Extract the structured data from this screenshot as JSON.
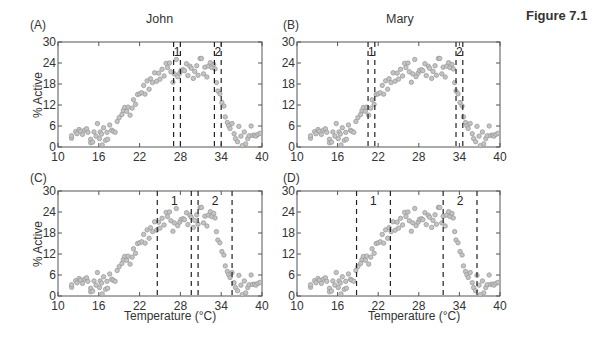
{
  "figure": {
    "title": "Figure 7.1"
  },
  "chart_data": [
    {
      "panel": "(A)",
      "title": "John",
      "type": "scatter",
      "xlabel": "",
      "ylabel": "% Active",
      "xlim": [
        10,
        40
      ],
      "ylim": [
        0,
        30
      ],
      "xticks": [
        10,
        16,
        22,
        28,
        34,
        40
      ],
      "yticks": [
        0,
        6,
        12,
        18,
        24,
        30
      ],
      "intervals": [
        {
          "label": "1",
          "from": 27,
          "to": 28
        },
        {
          "label": "2",
          "from": 33,
          "to": 34
        }
      ]
    },
    {
      "panel": "(B)",
      "title": "Mary",
      "type": "scatter",
      "xlabel": "",
      "ylabel": "",
      "xlim": [
        10,
        40
      ],
      "ylim": [
        0,
        30
      ],
      "xticks": [
        10,
        16,
        22,
        28,
        34,
        40
      ],
      "yticks": [
        0,
        6,
        12,
        18,
        24,
        30
      ],
      "intervals": [
        {
          "label": "1",
          "from": 20.5,
          "to": 21.5
        },
        {
          "label": "2",
          "from": 33.5,
          "to": 34.5
        }
      ]
    },
    {
      "panel": "(C)",
      "title": "",
      "type": "scatter",
      "xlabel": "Temperature (°C)",
      "ylabel": "% Active",
      "xlim": [
        10,
        40
      ],
      "ylim": [
        0,
        30
      ],
      "xticks": [
        10,
        16,
        22,
        28,
        34,
        40
      ],
      "yticks": [
        0,
        6,
        12,
        18,
        24,
        30
      ],
      "intervals": [
        {
          "label": "1",
          "from": 24.6,
          "to": 29.6
        },
        {
          "label": "2",
          "from": 30.6,
          "to": 35.6
        }
      ]
    },
    {
      "panel": "(D)",
      "title": "",
      "type": "scatter",
      "xlabel": "Temperature (°C)",
      "ylabel": "",
      "xlim": [
        10,
        40
      ],
      "ylim": [
        0,
        30
      ],
      "xticks": [
        10,
        16,
        22,
        28,
        34,
        40
      ],
      "yticks": [
        0,
        6,
        12,
        18,
        24,
        30
      ],
      "intervals": [
        {
          "label": "1",
          "from": 18.8,
          "to": 23.8
        },
        {
          "label": "2",
          "from": 31.6,
          "to": 36.6
        }
      ]
    }
  ],
  "scatter_points": [
    [
      12,
      2.5
    ],
    [
      12,
      3.2
    ],
    [
      12.6,
      4.4
    ],
    [
      12.8,
      3.8
    ],
    [
      13.1,
      5
    ],
    [
      13.3,
      4.5
    ],
    [
      13.6,
      3.6
    ],
    [
      13.9,
      4.8
    ],
    [
      14.2,
      5.2
    ],
    [
      14.4,
      4.2
    ],
    [
      14.8,
      2.2
    ],
    [
      14.8,
      1.2
    ],
    [
      15.1,
      1.4
    ],
    [
      15.3,
      4.3
    ],
    [
      15.6,
      3.1
    ],
    [
      15.8,
      6.7
    ],
    [
      16.1,
      2.4
    ],
    [
      16.2,
      4.3
    ],
    [
      16.4,
      3.7
    ],
    [
      16.5,
      0.6
    ],
    [
      16.7,
      5.5
    ],
    [
      17,
      1.9
    ],
    [
      17.2,
      4.2
    ],
    [
      17.3,
      2.2
    ],
    [
      17.6,
      6.3
    ],
    [
      17.9,
      4.8
    ],
    [
      18.1,
      4.5
    ],
    [
      18.4,
      4.2
    ],
    [
      18.7,
      7.3
    ],
    [
      19,
      8.4
    ],
    [
      19.4,
      9.3
    ],
    [
      19.6,
      10.4
    ],
    [
      19.8,
      11.3
    ],
    [
      20.1,
      10.2
    ],
    [
      20.3,
      11.4
    ],
    [
      20.6,
      9.1
    ],
    [
      20.9,
      11.1
    ],
    [
      21.1,
      13.5
    ],
    [
      21.4,
      12.2
    ],
    [
      21.7,
      15
    ],
    [
      22,
      15.2
    ],
    [
      22.3,
      15.5
    ],
    [
      22.6,
      17.6
    ],
    [
      22.8,
      15.1
    ],
    [
      23.1,
      18.9
    ],
    [
      23.4,
      16.5
    ],
    [
      23.6,
      19.5
    ],
    [
      23.9,
      18.4
    ],
    [
      24.2,
      21.2
    ],
    [
      24.5,
      18.8
    ],
    [
      24.8,
      21.1
    ],
    [
      25,
      19.4
    ],
    [
      25.3,
      22.2
    ],
    [
      25.6,
      20.3
    ],
    [
      25.9,
      23.9
    ],
    [
      26.1,
      22.7
    ],
    [
      26.4,
      24
    ],
    [
      26.6,
      21.5
    ],
    [
      26.9,
      18.5
    ],
    [
      27.1,
      20.9
    ],
    [
      27.4,
      25
    ],
    [
      27.6,
      20.1
    ],
    [
      27.9,
      21.1
    ],
    [
      28.1,
      21.9
    ],
    [
      28.4,
      22.1
    ],
    [
      28.6,
      21.8
    ],
    [
      28.9,
      23.8
    ],
    [
      29.1,
      20.4
    ],
    [
      29.4,
      23.1
    ],
    [
      29.6,
      22.5
    ],
    [
      29.9,
      19.6
    ],
    [
      30.1,
      21.6
    ],
    [
      30.4,
      23.2
    ],
    [
      30.6,
      20.5
    ],
    [
      30.9,
      25.3
    ],
    [
      31.1,
      25.3
    ],
    [
      31.4,
      20.9
    ],
    [
      31.6,
      22.8
    ],
    [
      31.9,
      20
    ],
    [
      32.1,
      23.1
    ],
    [
      32.4,
      24.1
    ],
    [
      32.6,
      22.7
    ],
    [
      32.9,
      23.6
    ],
    [
      33.1,
      22.3
    ],
    [
      33.3,
      18.4
    ],
    [
      33.5,
      16
    ],
    [
      33.8,
      15.2
    ],
    [
      34.1,
      12.7
    ],
    [
      34.4,
      11.7
    ],
    [
      34.6,
      8.6
    ],
    [
      34.9,
      7
    ],
    [
      35.1,
      6.1
    ],
    [
      35.3,
      5.3
    ],
    [
      35.6,
      6.7
    ],
    [
      35.9,
      3.8
    ],
    [
      36.1,
      2.4
    ],
    [
      36.4,
      1.5
    ],
    [
      36.6,
      5.9
    ],
    [
      36.9,
      3.1
    ],
    [
      37.1,
      0.4
    ],
    [
      37.4,
      4.3
    ],
    [
      37.6,
      0.9
    ],
    [
      37.9,
      2.4
    ],
    [
      38.1,
      3.2
    ],
    [
      38.4,
      6
    ],
    [
      38.6,
      3.3
    ],
    [
      38.9,
      3.4
    ],
    [
      39.1,
      3.1
    ],
    [
      39.4,
      3.6
    ],
    [
      39.7,
      3.9
    ]
  ],
  "colors": {
    "point": "#9a9a9a",
    "point_fill": "#c4c4c4",
    "axis": "#555555",
    "dash": "#222222"
  }
}
